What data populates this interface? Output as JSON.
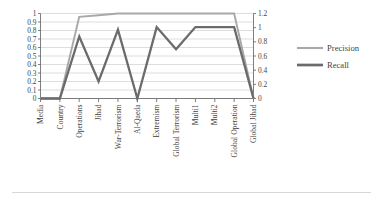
{
  "chart_data": {
    "type": "line",
    "title": "",
    "xlabel": "",
    "ylabel": "",
    "categories": [
      "Media",
      "Country",
      "Operations",
      "Jihad",
      "War-Terrorism",
      "Al-Qaeda",
      "Extremism",
      "Global Terrorism",
      "Multi1",
      "Multi2",
      "Global Operation",
      "Global Jihad"
    ],
    "series": [
      {
        "name": "Precision",
        "axis": "left",
        "color": "#a8a8a8",
        "values": [
          0,
          0,
          0.96,
          0.98,
          1,
          1,
          1,
          1,
          1,
          1,
          1,
          0
        ]
      },
      {
        "name": "Recall",
        "axis": "left",
        "color": "#6b6b6b",
        "values": [
          0,
          0,
          0.73,
          0.2,
          0.81,
          0,
          0.84,
          0.58,
          0.84,
          0.84,
          0.84,
          0
        ]
      }
    ],
    "left_axis": {
      "ticks": [
        "0",
        "0.1",
        "0.2",
        "0.3",
        "0.4",
        "0.5",
        "0.6",
        "0.7",
        "0.8",
        "0.9",
        "1"
      ],
      "min": 0,
      "max": 1
    },
    "right_axis": {
      "ticks": [
        "0",
        "0.2",
        "0.4",
        "0.6",
        "0.8",
        "1",
        "1.2"
      ],
      "min": 0,
      "max": 1.2
    },
    "legend": {
      "position": "right",
      "entries": [
        {
          "label": "Precision",
          "color": "#a8a8a8"
        },
        {
          "label": "Recall",
          "color": "#6b6b6b"
        }
      ]
    },
    "grid": true
  },
  "legend": {
    "precision_label": "Precision",
    "recall_label": "Recall"
  }
}
